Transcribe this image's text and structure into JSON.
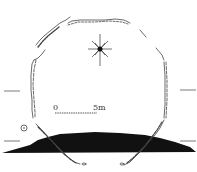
{
  "diagram": {
    "type": "archaeological-site-plan",
    "feature": "stone-lined enclosure (octagonal wall outline)",
    "north_marker": "compass-star",
    "scale_bar": {
      "start_label": "0",
      "end_label": "5m"
    },
    "section": {
      "type": "profile",
      "fill_color": "#111111"
    },
    "section_line_markers": [
      "left-upper",
      "left-lower",
      "right-upper",
      "right-lower"
    ],
    "colors": {
      "line": "#444444",
      "background": "#ffffff",
      "profile_fill": "#111111"
    }
  }
}
